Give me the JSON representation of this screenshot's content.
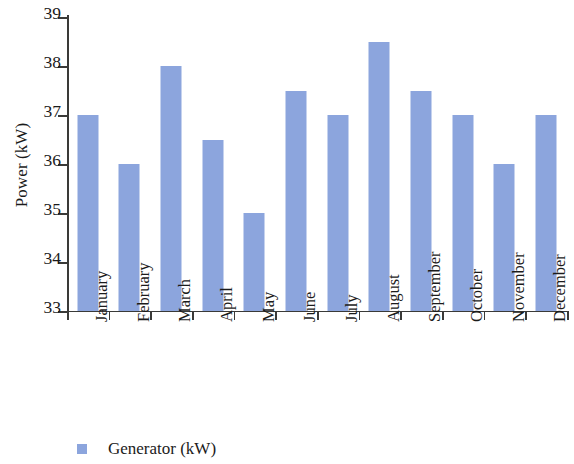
{
  "chart_data": {
    "type": "bar",
    "title": "",
    "subtitle": "",
    "xlabel": "",
    "ylabel": "Power (kW)",
    "categories": [
      "January",
      "February",
      "March",
      "April",
      "May",
      "June",
      "July",
      "August",
      "September",
      "October",
      "November",
      "December"
    ],
    "values": [
      37,
      36,
      38,
      36.5,
      35,
      37.5,
      37,
      38.5,
      37.5,
      37,
      36,
      37
    ],
    "series": [
      {
        "name": "Generator (kW)",
        "values": [
          37,
          36,
          38,
          36.5,
          35,
          37.5,
          37,
          38.5,
          37.5,
          37,
          36,
          37
        ],
        "color": "#8ca5dd"
      }
    ],
    "ylim": [
      33,
      39
    ],
    "yticks": [
      33,
      34,
      35,
      36,
      37,
      38,
      39
    ],
    "ytick_labels": [
      "33",
      "34",
      "35",
      "36",
      "37",
      "38",
      "39"
    ],
    "grid": false,
    "legend": {
      "position": "bottom-left",
      "entries": [
        {
          "label": "Generator (kW)",
          "color": "#8ca5dd",
          "marker": "square"
        }
      ]
    },
    "xtick_label_rotation": -90,
    "axis_color": "#3a3a38",
    "background_color": "#ffffff"
  }
}
